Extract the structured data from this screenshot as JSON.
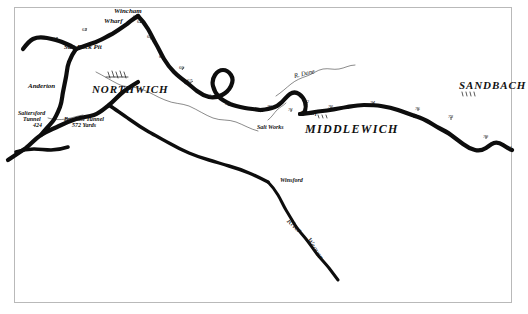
{
  "map": {
    "title": "Trent & Mersey Canal - Northwich to Sandbach",
    "frame_color": "#b9b9b9",
    "ink_color": "#111111",
    "paper_color": "#ffffff",
    "towns": [
      {
        "id": "northwich",
        "label": "NORTHWICH",
        "x": 92,
        "y": 84
      },
      {
        "id": "middlewich",
        "label": "MIDDLEWICH",
        "x": 305,
        "y": 123
      },
      {
        "id": "sandbach",
        "label": "SANDBACH",
        "x": 459,
        "y": 87
      }
    ],
    "places": [
      {
        "id": "wincham",
        "label": "Wincham",
        "x": 114,
        "y": 13
      },
      {
        "id": "wharf-wincham",
        "label": "Wharf",
        "x": 106,
        "y": 22
      },
      {
        "id": "salt-rock-pit",
        "label": "Salt Rock Pit",
        "x": 66,
        "y": 47
      },
      {
        "id": "anderton",
        "label": "Anderton",
        "x": 30,
        "y": 86
      },
      {
        "id": "saltersford-tunnel",
        "label": "Saltersford",
        "x": 20,
        "y": 112
      },
      {
        "id": "saltersford-tunnel-2",
        "label": "Tunnel",
        "x": 25,
        "y": 118
      },
      {
        "id": "saltersford-tunnel-3",
        "label": "424",
        "x": 34,
        "y": 124
      },
      {
        "id": "barnton-tunnel",
        "label": "Barnton Tunnel",
        "x": 66,
        "y": 118
      },
      {
        "id": "barnton-yards",
        "label": "572 Yards",
        "x": 74,
        "y": 124
      },
      {
        "id": "salt-works",
        "label": "Salt Works",
        "x": 259,
        "y": 126
      },
      {
        "id": "wharf-middlewich",
        "label": "Wharf",
        "x": 303,
        "y": 113
      },
      {
        "id": "winsford",
        "label": "Winsford",
        "x": 280,
        "y": 180
      }
    ],
    "rivers": [
      {
        "id": "river-dane",
        "label": "R. Dane",
        "x": 296,
        "y": 76,
        "rotate": -13
      },
      {
        "id": "river-weaver-word-river",
        "label": "River",
        "x": 290,
        "y": 219,
        "rotate": 44
      },
      {
        "id": "river-weaver-word-weaver",
        "label": "Weaver",
        "x": 310,
        "y": 238,
        "rotate": 56
      }
    ],
    "mile_markers": [
      {
        "label": "61",
        "x": 53,
        "y": 42
      },
      {
        "label": "62",
        "x": 82,
        "y": 33
      },
      {
        "label": "63",
        "x": 136,
        "y": 25
      },
      {
        "label": "64",
        "x": 146,
        "y": 37
      },
      {
        "label": "65",
        "x": 158,
        "y": 57
      },
      {
        "label": "66",
        "x": 178,
        "y": 68
      },
      {
        "label": "67",
        "x": 186,
        "y": 81
      },
      {
        "label": "68",
        "x": 205,
        "y": 96
      },
      {
        "label": "69",
        "x": 224,
        "y": 104
      },
      {
        "label": "70",
        "x": 266,
        "y": 107
      },
      {
        "label": "71",
        "x": 287,
        "y": 111
      },
      {
        "label": "72",
        "x": 303,
        "y": 103
      },
      {
        "label": "73",
        "x": 327,
        "y": 107
      },
      {
        "label": "74",
        "x": 369,
        "y": 104
      },
      {
        "label": "75",
        "x": 414,
        "y": 109
      },
      {
        "label": "76",
        "x": 441,
        "y": 117
      },
      {
        "label": "78",
        "x": 447,
        "y": 118
      },
      {
        "label": "79",
        "x": 482,
        "y": 137
      },
      {
        "label": "81",
        "x": 506,
        "y": 148
      }
    ]
  }
}
